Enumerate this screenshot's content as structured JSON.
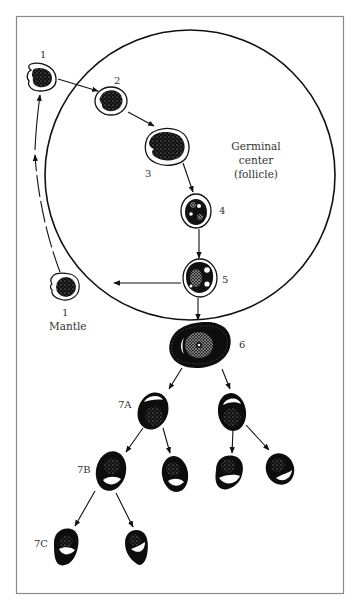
{
  "diagram": {
    "type": "B-cell differentiation in lymphoid follicle",
    "region_label": {
      "line1": "Germinal",
      "line2": "center",
      "line3": "(follicle)"
    },
    "mantle_label": "Mantle",
    "stages": [
      {
        "id": "1",
        "label": "1",
        "location": "mantle-top"
      },
      {
        "id": "2",
        "label": "2",
        "location": "germinal-center"
      },
      {
        "id": "3",
        "label": "3",
        "location": "germinal-center"
      },
      {
        "id": "4",
        "label": "4",
        "location": "germinal-center"
      },
      {
        "id": "5",
        "label": "5",
        "location": "germinal-center"
      },
      {
        "id": "1b",
        "label": "1",
        "location": "mantle"
      },
      {
        "id": "6",
        "label": "6",
        "location": "outside"
      },
      {
        "id": "7A",
        "label": "7A",
        "location": "outside"
      },
      {
        "id": "7B",
        "label": "7B",
        "location": "outside"
      },
      {
        "id": "7C",
        "label": "7C",
        "location": "outside"
      }
    ],
    "colors": {
      "ink": "#111111",
      "frame": "#8a8a8a",
      "background": "#ffffff"
    }
  }
}
